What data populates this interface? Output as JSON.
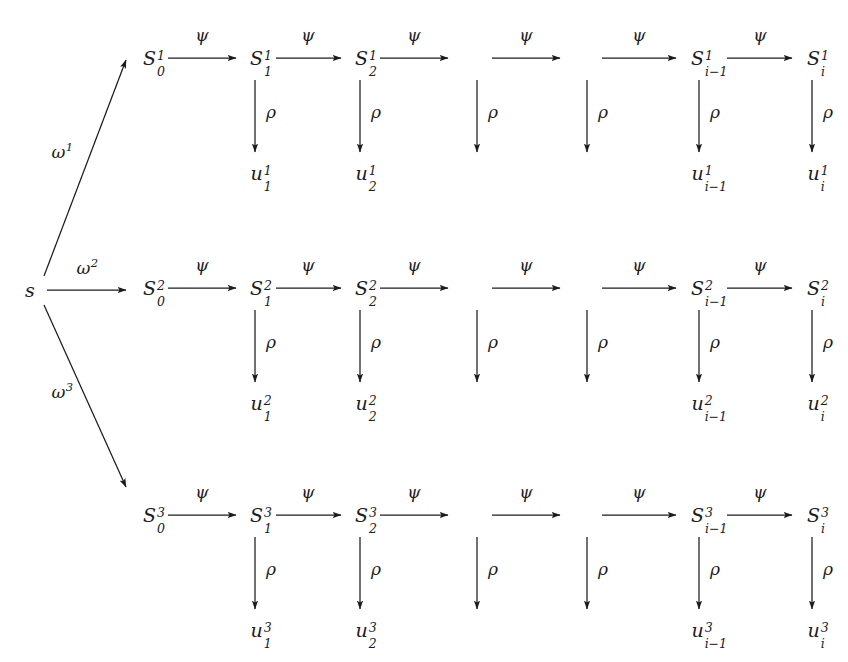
{
  "figure": {
    "kind": "commutative-diagram",
    "background_color": "#ffffff",
    "ink_color": "#1c1c1c",
    "width": 848,
    "height": 662
  },
  "symbols": {
    "psi": "ψ",
    "rho": "ρ",
    "omega": "ω",
    "S": "S",
    "u": "u",
    "s": "s",
    "minus_one": "−1"
  },
  "root": {
    "label": "s",
    "x": 30,
    "y": 290
  },
  "branches": [
    {
      "name": "omega-1",
      "label_base": "ω",
      "label_sup": "1",
      "label_x": 62,
      "label_y": 152,
      "from_x": 44,
      "from_y": 276,
      "to_x": 126,
      "to_y": 60
    },
    {
      "name": "omega-2",
      "label_base": "ω",
      "label_sup": "2",
      "label_x": 87,
      "label_y": 268,
      "from_x": 47,
      "from_y": 290,
      "to_x": 126,
      "to_y": 290
    },
    {
      "name": "omega-3",
      "label_base": "ω",
      "label_sup": "3",
      "label_x": 62,
      "label_y": 392,
      "from_x": 44,
      "from_y": 305,
      "to_x": 126,
      "to_y": 487
    }
  ],
  "rows": [
    {
      "index": 1,
      "superscript": "1",
      "state_y": 58,
      "output_y": 173,
      "rho_from_y": 80,
      "rho_to_y": 152
    },
    {
      "index": 2,
      "superscript": "2",
      "state_y": 288,
      "output_y": 403,
      "rho_from_y": 310,
      "rho_to_y": 382
    },
    {
      "index": 3,
      "superscript": "3",
      "state_y": 515,
      "output_y": 630,
      "rho_from_y": 537,
      "rho_to_y": 609
    }
  ],
  "columns": [
    {
      "key": "k0",
      "state_sub": "0",
      "output_sub": null,
      "x": 148,
      "has_state_label": true,
      "has_rho": false,
      "has_output": false
    },
    {
      "key": "k1",
      "state_sub": "1",
      "output_sub": "1",
      "x": 255,
      "has_state_label": true,
      "has_rho": true,
      "has_output": true
    },
    {
      "key": "k2",
      "state_sub": "2",
      "output_sub": "2",
      "x": 360,
      "has_state_label": true,
      "has_rho": true,
      "has_output": true
    },
    {
      "key": "gap1",
      "state_sub": null,
      "output_sub": null,
      "x": 477,
      "has_state_label": false,
      "has_rho": true,
      "has_output": false
    },
    {
      "key": "gap2",
      "state_sub": null,
      "output_sub": null,
      "x": 587,
      "has_state_label": false,
      "has_rho": true,
      "has_output": false
    },
    {
      "key": "ki1",
      "state_sub": "i−1",
      "output_sub": "i−1",
      "x": 699,
      "has_state_label": true,
      "has_rho": true,
      "has_output": true
    },
    {
      "key": "ki",
      "state_sub": "i",
      "output_sub": "i",
      "x": 812,
      "has_state_label": true,
      "has_rho": true,
      "has_output": true
    }
  ],
  "psi_edges": [
    {
      "key": "e0",
      "from_x": 168,
      "to_x": 236,
      "label_x": 202
    },
    {
      "key": "e1",
      "from_x": 276,
      "to_x": 341,
      "label_x": 308
    },
    {
      "key": "e2",
      "from_x": 380,
      "to_x": 448,
      "label_x": 414
    },
    {
      "key": "e3",
      "from_x": 492,
      "to_x": 560,
      "label_x": 526
    },
    {
      "key": "e4",
      "from_x": 602,
      "to_x": 676,
      "label_x": 639
    },
    {
      "key": "e5",
      "from_x": 727,
      "to_x": 792,
      "label_x": 760
    }
  ],
  "labels": {
    "psi_label": "ψ",
    "rho_label": "ρ",
    "psi_edge_name": "psi-edge-label",
    "rho_edge_name": "rho-edge-label"
  }
}
